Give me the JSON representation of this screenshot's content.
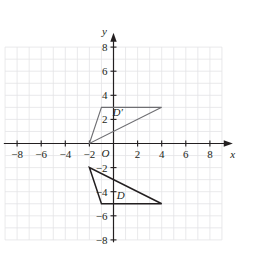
{
  "figure": {
    "background_color": "#ffffff",
    "grid_color": "#e3e3e6",
    "axis_color": "#231f20",
    "origin_label": "O",
    "x_axis_name": "x",
    "y_axis_name": "y"
  },
  "chart_data": {
    "type": "scatter",
    "title": "",
    "xlabel": "x",
    "ylabel": "y",
    "xlim": [
      -9,
      9
    ],
    "ylim": [
      -8,
      8
    ],
    "grid": true,
    "grid_step": 1,
    "legend": "none",
    "x_tick_labels": [
      "−8",
      "−6",
      "−4",
      "−2",
      "2",
      "4",
      "6",
      "8"
    ],
    "x_tick_values": [
      -8,
      -6,
      -4,
      -2,
      2,
      4,
      6,
      8
    ],
    "y_tick_labels": [
      "8",
      "6",
      "4",
      "2",
      "−2",
      "−4",
      "−6",
      "−8"
    ],
    "y_tick_values": [
      8,
      6,
      4,
      2,
      -2,
      -4,
      -6,
      -8
    ],
    "annotations": [
      {
        "text": "D′",
        "x": 0.35,
        "y": 2.65
      },
      {
        "text": "D",
        "x": 0.6,
        "y": -4.3
      }
    ],
    "series": [
      {
        "name": "D′",
        "label": "D′",
        "type": "polygon",
        "color": "#6e6e72",
        "stroke_width": 1.1,
        "points": [
          {
            "x": -2,
            "y": 0
          },
          {
            "x": -1,
            "y": 3
          },
          {
            "x": 4,
            "y": 3
          }
        ]
      },
      {
        "name": "D",
        "label": "D",
        "type": "polygon",
        "color": "#231f20",
        "stroke_width": 1.5,
        "points": [
          {
            "x": -2,
            "y": -2
          },
          {
            "x": -1,
            "y": -5
          },
          {
            "x": 4,
            "y": -5
          }
        ]
      }
    ]
  }
}
